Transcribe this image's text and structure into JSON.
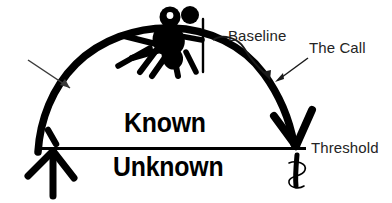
{
  "diagram": {
    "colors": {
      "ink": "#000000",
      "text": "#242424",
      "background": "#ffffff"
    },
    "labels": {
      "baseline": "Baseline",
      "the_call": "The Call",
      "threshold": "Threshold",
      "known": "Known",
      "unknown": "Unknown"
    },
    "elements": {
      "arc_name": "known-unknown-arc",
      "horizontal_line_name": "threshold-line",
      "figure_name": "climber-figure",
      "pole_name": "flag-pole",
      "up_arrow_name": "start-up-arrow",
      "down_arrow_name": "end-down-arrow",
      "pointer_arrow_name": "left-pointer-arrow",
      "baseline_arrow_name": "baseline-curved-arrow",
      "call_arrow_name": "the-call-arrow",
      "squiggle_name": "threshold-squiggle"
    }
  }
}
